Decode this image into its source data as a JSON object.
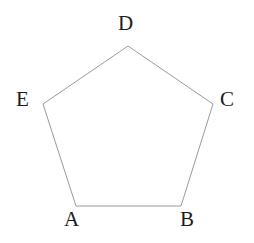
{
  "figure": {
    "type": "polygon-diagram",
    "shape_name": "pentagon",
    "background_color": "#ffffff",
    "stroke_color": "#9a9a9a",
    "stroke_width": 1,
    "fill": "none",
    "label_color": "#1c1c1c",
    "canvas": {
      "width": 254,
      "height": 243
    },
    "vertices": [
      {
        "id": "A",
        "label": "A",
        "x": 76,
        "y": 206,
        "label_x": 64,
        "label_y": 209
      },
      {
        "id": "B",
        "label": "B",
        "x": 181,
        "y": 206,
        "label_x": 180,
        "label_y": 209
      },
      {
        "id": "C",
        "label": "C",
        "x": 213,
        "y": 104,
        "label_x": 220,
        "label_y": 89
      },
      {
        "id": "D",
        "label": "D",
        "x": 128,
        "y": 46,
        "label_x": 118,
        "label_y": 13
      },
      {
        "id": "E",
        "label": "E",
        "x": 43,
        "y": 104,
        "label_x": 16,
        "label_y": 89
      }
    ],
    "edges": [
      {
        "from": "A",
        "to": "B"
      },
      {
        "from": "B",
        "to": "C"
      },
      {
        "from": "C",
        "to": "D"
      },
      {
        "from": "D",
        "to": "E"
      },
      {
        "from": "E",
        "to": "A"
      }
    ],
    "points_attr": "76,206 181,206 213,104 128,46 43,104"
  }
}
